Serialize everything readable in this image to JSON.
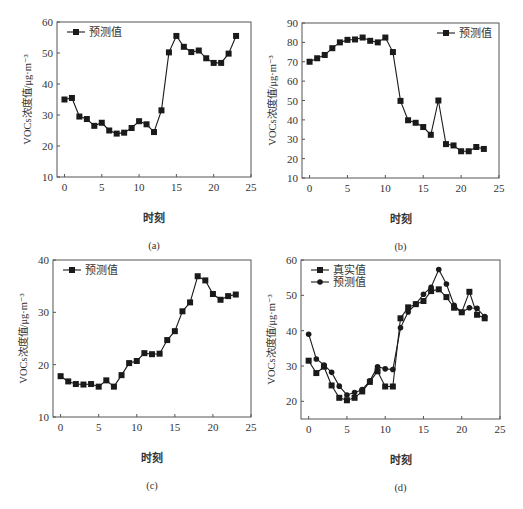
{
  "chart_data": [
    {
      "id": "a",
      "type": "line",
      "caption": "(a)",
      "xlabel": "时刻",
      "ylabel": "VOCs浓度值/μg·m⁻³",
      "xlim": [
        -1,
        25
      ],
      "ylim": [
        10,
        60
      ],
      "xticks": [
        0,
        5,
        10,
        15,
        20,
        25
      ],
      "yticks": [
        10,
        20,
        30,
        40,
        50,
        60
      ],
      "legend_position": "upper-left",
      "grid": false,
      "x": [
        0,
        1,
        2,
        3,
        4,
        5,
        6,
        7,
        8,
        9,
        10,
        11,
        12,
        13,
        14,
        15,
        16,
        17,
        18,
        19,
        20,
        21,
        22,
        23
      ],
      "series": [
        {
          "name": "预测值",
          "marker": "square",
          "values": [
            35,
            35.5,
            29.5,
            28.7,
            26.5,
            27.5,
            25,
            24,
            24.3,
            25.8,
            28,
            27,
            24.5,
            31.5,
            50.2,
            55.5,
            52,
            50.3,
            50.8,
            48.3,
            46.8,
            46.8,
            49.8,
            55.5
          ]
        }
      ]
    },
    {
      "id": "b",
      "type": "line",
      "caption": "(b)",
      "xlabel": "时刻",
      "ylabel": "VOCs浓度值/μg·m⁻³",
      "xlim": [
        -1,
        25
      ],
      "ylim": [
        10,
        90
      ],
      "xticks": [
        0,
        5,
        10,
        15,
        20,
        25
      ],
      "yticks": [
        10,
        20,
        30,
        40,
        50,
        60,
        70,
        80,
        90
      ],
      "legend_position": "upper-right",
      "grid": false,
      "x": [
        0,
        1,
        2,
        3,
        4,
        5,
        6,
        7,
        8,
        9,
        10,
        11,
        12,
        13,
        14,
        15,
        16,
        17,
        18,
        19,
        20,
        21,
        22,
        23
      ],
      "series": [
        {
          "name": "预测值",
          "marker": "square",
          "values": [
            70,
            71.8,
            73.5,
            77,
            80,
            81.3,
            81.5,
            82.5,
            80.8,
            80,
            82.5,
            75,
            49.8,
            39.8,
            38.5,
            36.3,
            32.3,
            50,
            27.5,
            26.8,
            23.8,
            23.8,
            26,
            25
          ]
        }
      ]
    },
    {
      "id": "c",
      "type": "line",
      "caption": "(c)",
      "xlabel": "时刻",
      "ylabel": "VOCs浓度值/μg·m⁻³",
      "xlim": [
        -1,
        25
      ],
      "ylim": [
        10,
        40
      ],
      "xticks": [
        0,
        5,
        10,
        15,
        20,
        25
      ],
      "yticks": [
        10,
        20,
        30,
        40
      ],
      "legend_position": "upper-left",
      "grid": false,
      "x": [
        0,
        1,
        2,
        3,
        4,
        5,
        6,
        7,
        8,
        9,
        10,
        11,
        12,
        13,
        14,
        15,
        16,
        17,
        18,
        19,
        20,
        21,
        22,
        23
      ],
      "series": [
        {
          "name": "预测值",
          "marker": "square",
          "values": [
            17.8,
            16.8,
            16.3,
            16.2,
            16.3,
            15.8,
            17,
            15.8,
            18,
            20.3,
            20.7,
            22.2,
            22,
            22.1,
            24.7,
            26.4,
            30.2,
            31.9,
            36.9,
            36.1,
            33.5,
            32.4,
            33.1,
            33.4
          ]
        }
      ]
    },
    {
      "id": "d",
      "type": "line",
      "caption": "(d)",
      "xlabel": "时刻",
      "ylabel": "VOCs浓度值/μg·m⁻³",
      "xlim": [
        -1,
        25
      ],
      "ylim": [
        15,
        60
      ],
      "xticks": [
        0,
        5,
        10,
        15,
        20,
        25
      ],
      "yticks": [
        20,
        30,
        40,
        50,
        60
      ],
      "legend_position": "upper-left",
      "grid": false,
      "x": [
        0,
        1,
        2,
        3,
        4,
        5,
        6,
        7,
        8,
        9,
        10,
        11,
        12,
        13,
        14,
        15,
        16,
        17,
        18,
        19,
        20,
        21,
        22,
        23
      ],
      "series": [
        {
          "name": "真实值",
          "marker": "square",
          "values": [
            31.5,
            28,
            29.8,
            24.5,
            21,
            20.3,
            21,
            22.8,
            25.5,
            28.5,
            24.2,
            24.2,
            43.5,
            46.6,
            47.5,
            48.4,
            51.2,
            51.7,
            49.5,
            46.5,
            45.2,
            51,
            44.5,
            43.5
          ]
        },
        {
          "name": "预测值",
          "marker": "circle",
          "values": [
            39,
            32,
            30.3,
            28.2,
            24.3,
            21.8,
            22.5,
            23.3,
            25.8,
            29.8,
            29.2,
            29,
            40.8,
            45.3,
            47.5,
            50.3,
            52.3,
            57.3,
            53.2,
            47.2,
            45.2,
            46.5,
            46.3,
            44
          ]
        }
      ]
    }
  ],
  "layout": {
    "panels": [
      {
        "left": 0,
        "top": 0,
        "plot": {
          "x": 57,
          "y": 22,
          "w": 194,
          "h": 155
        }
      },
      {
        "left": 260,
        "top": 0,
        "plot": {
          "x": 42,
          "y": 23,
          "w": 197,
          "h": 155
        }
      },
      {
        "left": 0,
        "top": 250,
        "plot": {
          "x": 53,
          "y": 10,
          "w": 198,
          "h": 157
        }
      },
      {
        "left": 260,
        "top": 250,
        "plot": {
          "x": 41,
          "y": 10,
          "w": 199,
          "h": 159
        }
      }
    ],
    "line_color": "#1a1a1a",
    "axis_color": "#555555"
  }
}
